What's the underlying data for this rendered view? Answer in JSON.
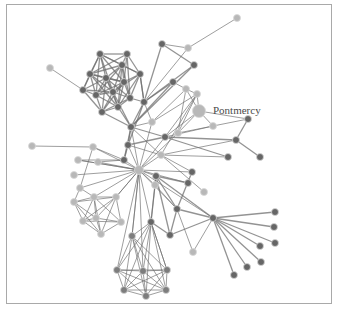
{
  "diagram": {
    "type": "force-directed-network",
    "label": {
      "text": "Pontmercy",
      "x": 213,
      "y": 114
    },
    "colors": {
      "dark": "#666666",
      "mid": "#7d7d7d",
      "light": "#b8b8b8",
      "edge": "#6f6f6f",
      "frame": "#a9a9a9"
    },
    "nodes": [
      {
        "id": 0,
        "x": 139,
        "y": 170,
        "r": 4.5,
        "c": "light"
      },
      {
        "id": 1,
        "x": 131,
        "y": 127,
        "r": 3.5,
        "c": "dark"
      },
      {
        "id": 2,
        "x": 144,
        "y": 102,
        "r": 3.5,
        "c": "dark"
      },
      {
        "id": 3,
        "x": 162,
        "y": 44,
        "r": 3.5,
        "c": "dark"
      },
      {
        "id": 4,
        "x": 188,
        "y": 48,
        "r": 3.5,
        "c": "light"
      },
      {
        "id": 5,
        "x": 237,
        "y": 18,
        "r": 3.5,
        "c": "light"
      },
      {
        "id": 6,
        "x": 194,
        "y": 65,
        "r": 3.5,
        "c": "dark"
      },
      {
        "id": 7,
        "x": 173,
        "y": 82,
        "r": 3.5,
        "c": "dark"
      },
      {
        "id": 8,
        "x": 186,
        "y": 89,
        "r": 3.5,
        "c": "light"
      },
      {
        "id": 9,
        "x": 199,
        "y": 111,
        "r": 6.5,
        "c": "light"
      },
      {
        "id": 10,
        "x": 197,
        "y": 94,
        "r": 3.5,
        "c": "light"
      },
      {
        "id": 11,
        "x": 213,
        "y": 126,
        "r": 3.5,
        "c": "light"
      },
      {
        "id": 12,
        "x": 248,
        "y": 119,
        "r": 3.5,
        "c": "dark"
      },
      {
        "id": 13,
        "x": 236,
        "y": 140,
        "r": 3.5,
        "c": "dark"
      },
      {
        "id": 14,
        "x": 260,
        "y": 157,
        "r": 3.5,
        "c": "dark"
      },
      {
        "id": 15,
        "x": 228,
        "y": 157,
        "r": 3.5,
        "c": "dark"
      },
      {
        "id": 16,
        "x": 192,
        "y": 172,
        "r": 3.5,
        "c": "dark"
      },
      {
        "id": 17,
        "x": 188,
        "y": 183,
        "r": 3.5,
        "c": "dark"
      },
      {
        "id": 18,
        "x": 204,
        "y": 192,
        "r": 3.5,
        "c": "light"
      },
      {
        "id": 19,
        "x": 213,
        "y": 218,
        "r": 3.5,
        "c": "dark"
      },
      {
        "id": 20,
        "x": 275,
        "y": 212,
        "r": 3.5,
        "c": "dark"
      },
      {
        "id": 21,
        "x": 274,
        "y": 227,
        "r": 3.5,
        "c": "dark"
      },
      {
        "id": 22,
        "x": 275,
        "y": 243,
        "r": 3.5,
        "c": "dark"
      },
      {
        "id": 23,
        "x": 260,
        "y": 246,
        "r": 3.5,
        "c": "dark"
      },
      {
        "id": 24,
        "x": 261,
        "y": 262,
        "r": 3.5,
        "c": "dark"
      },
      {
        "id": 25,
        "x": 247,
        "y": 267,
        "r": 3.5,
        "c": "dark"
      },
      {
        "id": 26,
        "x": 234,
        "y": 275,
        "r": 3.5,
        "c": "dark"
      },
      {
        "id": 27,
        "x": 193,
        "y": 252,
        "r": 3.5,
        "c": "light"
      },
      {
        "id": 28,
        "x": 177,
        "y": 209,
        "r": 3.5,
        "c": "dark"
      },
      {
        "id": 29,
        "x": 170,
        "y": 235,
        "r": 3.5,
        "c": "dark"
      },
      {
        "id": 30,
        "x": 156,
        "y": 176,
        "r": 3.5,
        "c": "dark"
      },
      {
        "id": 31,
        "x": 161,
        "y": 155,
        "r": 3.5,
        "c": "light"
      },
      {
        "id": 32,
        "x": 165,
        "y": 137,
        "r": 3.5,
        "c": "dark"
      },
      {
        "id": 33,
        "x": 178,
        "y": 133,
        "r": 3.5,
        "c": "light"
      },
      {
        "id": 34,
        "x": 152,
        "y": 122,
        "r": 3.5,
        "c": "light"
      },
      {
        "id": 35,
        "x": 128,
        "y": 145,
        "r": 3.5,
        "c": "dark"
      },
      {
        "id": 36,
        "x": 32,
        "y": 146,
        "r": 3.5,
        "c": "light"
      },
      {
        "id": 37,
        "x": 93,
        "y": 147,
        "r": 3.5,
        "c": "light"
      },
      {
        "id": 38,
        "x": 78,
        "y": 160,
        "r": 3.5,
        "c": "light"
      },
      {
        "id": 39,
        "x": 98,
        "y": 162,
        "r": 3.5,
        "c": "light"
      },
      {
        "id": 40,
        "x": 74,
        "y": 175,
        "r": 3.5,
        "c": "light"
      },
      {
        "id": 41,
        "x": 80,
        "y": 188,
        "r": 3.5,
        "c": "light"
      },
      {
        "id": 42,
        "x": 94,
        "y": 197,
        "r": 3.5,
        "c": "light"
      },
      {
        "id": 43,
        "x": 74,
        "y": 202,
        "r": 3.5,
        "c": "light"
      },
      {
        "id": 44,
        "x": 116,
        "y": 197,
        "r": 3.5,
        "c": "light"
      },
      {
        "id": 45,
        "x": 96,
        "y": 218,
        "r": 3.5,
        "c": "light"
      },
      {
        "id": 46,
        "x": 83,
        "y": 221,
        "r": 3.5,
        "c": "light"
      },
      {
        "id": 47,
        "x": 121,
        "y": 222,
        "r": 3.5,
        "c": "light"
      },
      {
        "id": 48,
        "x": 101,
        "y": 234,
        "r": 3.5,
        "c": "light"
      },
      {
        "id": 49,
        "x": 151,
        "y": 222,
        "r": 3.5,
        "c": "dark"
      },
      {
        "id": 50,
        "x": 132,
        "y": 236,
        "r": 3.5,
        "c": "mid"
      },
      {
        "id": 51,
        "x": 117,
        "y": 270,
        "r": 3.5,
        "c": "mid"
      },
      {
        "id": 52,
        "x": 143,
        "y": 271,
        "r": 3.5,
        "c": "mid"
      },
      {
        "id": 53,
        "x": 167,
        "y": 270,
        "r": 3.5,
        "c": "mid"
      },
      {
        "id": 54,
        "x": 124,
        "y": 290,
        "r": 3.5,
        "c": "mid"
      },
      {
        "id": 55,
        "x": 146,
        "y": 296,
        "r": 3.5,
        "c": "mid"
      },
      {
        "id": 56,
        "x": 166,
        "y": 290,
        "r": 3.5,
        "c": "mid"
      },
      {
        "id": 57,
        "x": 50,
        "y": 68,
        "r": 3.5,
        "c": "light"
      },
      {
        "id": 58,
        "x": 83,
        "y": 90,
        "r": 3.5,
        "c": "dark"
      },
      {
        "id": 59,
        "x": 90,
        "y": 74,
        "r": 3.5,
        "c": "dark"
      },
      {
        "id": 60,
        "x": 100,
        "y": 54,
        "r": 3.5,
        "c": "dark"
      },
      {
        "id": 61,
        "x": 127,
        "y": 54,
        "r": 3.5,
        "c": "dark"
      },
      {
        "id": 62,
        "x": 122,
        "y": 65,
        "r": 3.5,
        "c": "dark"
      },
      {
        "id": 63,
        "x": 106,
        "y": 78,
        "r": 3.5,
        "c": "dark"
      },
      {
        "id": 64,
        "x": 124,
        "y": 82,
        "r": 3.5,
        "c": "dark"
      },
      {
        "id": 65,
        "x": 140,
        "y": 74,
        "r": 3.5,
        "c": "dark"
      },
      {
        "id": 66,
        "x": 96,
        "y": 95,
        "r": 3.5,
        "c": "dark"
      },
      {
        "id": 67,
        "x": 118,
        "y": 107,
        "r": 3.5,
        "c": "dark"
      },
      {
        "id": 68,
        "x": 102,
        "y": 112,
        "r": 3.5,
        "c": "dark"
      },
      {
        "id": 69,
        "x": 130,
        "y": 98,
        "r": 3.5,
        "c": "dark"
      },
      {
        "id": 70,
        "x": 113,
        "y": 92,
        "r": 3.5,
        "c": "dark"
      },
      {
        "id": 71,
        "x": 155,
        "y": 185,
        "r": 3.5,
        "c": "light"
      },
      {
        "id": 72,
        "x": 124,
        "y": 160,
        "r": 3.5,
        "c": "dark"
      }
    ],
    "edges": [
      [
        57,
        58
      ],
      [
        58,
        59
      ],
      [
        58,
        60
      ],
      [
        58,
        63
      ],
      [
        58,
        66
      ],
      [
        58,
        68
      ],
      [
        58,
        70
      ],
      [
        59,
        60
      ],
      [
        59,
        61
      ],
      [
        59,
        62
      ],
      [
        59,
        63
      ],
      [
        59,
        64
      ],
      [
        59,
        66
      ],
      [
        59,
        67
      ],
      [
        59,
        70
      ],
      [
        60,
        61
      ],
      [
        60,
        62
      ],
      [
        60,
        63
      ],
      [
        60,
        64
      ],
      [
        60,
        65
      ],
      [
        60,
        66
      ],
      [
        60,
        70
      ],
      [
        61,
        62
      ],
      [
        61,
        64
      ],
      [
        61,
        65
      ],
      [
        61,
        69
      ],
      [
        62,
        63
      ],
      [
        62,
        64
      ],
      [
        62,
        65
      ],
      [
        62,
        66
      ],
      [
        62,
        67
      ],
      [
        62,
        69
      ],
      [
        62,
        70
      ],
      [
        63,
        64
      ],
      [
        63,
        66
      ],
      [
        63,
        67
      ],
      [
        63,
        68
      ],
      [
        63,
        69
      ],
      [
        63,
        70
      ],
      [
        64,
        65
      ],
      [
        64,
        66
      ],
      [
        64,
        67
      ],
      [
        64,
        68
      ],
      [
        64,
        69
      ],
      [
        64,
        70
      ],
      [
        65,
        67
      ],
      [
        65,
        69
      ],
      [
        65,
        70
      ],
      [
        66,
        67
      ],
      [
        66,
        68
      ],
      [
        66,
        70
      ],
      [
        67,
        68
      ],
      [
        67,
        69
      ],
      [
        67,
        70
      ],
      [
        68,
        69
      ],
      [
        68,
        70
      ],
      [
        69,
        70
      ],
      [
        69,
        2
      ],
      [
        67,
        1
      ],
      [
        65,
        2
      ],
      [
        68,
        1
      ],
      [
        70,
        1
      ],
      [
        1,
        2
      ],
      [
        1,
        34
      ],
      [
        1,
        35
      ],
      [
        1,
        0
      ],
      [
        1,
        72
      ],
      [
        1,
        31
      ],
      [
        1,
        32
      ],
      [
        2,
        34
      ],
      [
        2,
        3
      ],
      [
        2,
        7
      ],
      [
        2,
        65
      ],
      [
        2,
        6
      ],
      [
        3,
        4
      ],
      [
        3,
        6
      ],
      [
        4,
        5
      ],
      [
        4,
        2
      ],
      [
        6,
        1
      ],
      [
        7,
        8
      ],
      [
        7,
        1
      ],
      [
        8,
        9
      ],
      [
        8,
        10
      ],
      [
        8,
        33
      ],
      [
        8,
        34
      ],
      [
        9,
        10
      ],
      [
        9,
        11
      ],
      [
        9,
        12
      ],
      [
        9,
        32
      ],
      [
        9,
        33
      ],
      [
        10,
        33
      ],
      [
        10,
        32
      ],
      [
        10,
        31
      ],
      [
        10,
        34
      ],
      [
        11,
        32
      ],
      [
        11,
        33
      ],
      [
        11,
        12
      ],
      [
        12,
        13
      ],
      [
        13,
        14
      ],
      [
        13,
        32
      ],
      [
        13,
        31
      ],
      [
        15,
        31
      ],
      [
        15,
        32
      ],
      [
        16,
        31
      ],
      [
        16,
        0
      ],
      [
        17,
        30
      ],
      [
        17,
        0
      ],
      [
        18,
        31
      ],
      [
        0,
        30
      ],
      [
        0,
        31
      ],
      [
        0,
        32
      ],
      [
        0,
        33
      ],
      [
        0,
        34
      ],
      [
        0,
        35
      ],
      [
        0,
        72
      ],
      [
        0,
        37
      ],
      [
        0,
        38
      ],
      [
        0,
        39
      ],
      [
        0,
        40
      ],
      [
        0,
        41
      ],
      [
        0,
        42
      ],
      [
        0,
        44
      ],
      [
        0,
        71
      ],
      [
        0,
        19
      ],
      [
        0,
        49
      ],
      [
        0,
        50
      ],
      [
        0,
        28
      ],
      [
        35,
        72
      ],
      [
        35,
        31
      ],
      [
        35,
        32
      ],
      [
        35,
        2
      ],
      [
        72,
        37
      ],
      [
        72,
        39
      ],
      [
        72,
        38
      ],
      [
        36,
        37
      ],
      [
        37,
        41
      ],
      [
        38,
        0
      ],
      [
        42,
        43
      ],
      [
        42,
        44
      ],
      [
        42,
        45
      ],
      [
        42,
        46
      ],
      [
        42,
        47
      ],
      [
        42,
        48
      ],
      [
        43,
        44
      ],
      [
        43,
        45
      ],
      [
        43,
        46
      ],
      [
        43,
        48
      ],
      [
        44,
        45
      ],
      [
        44,
        46
      ],
      [
        44,
        47
      ],
      [
        44,
        48
      ],
      [
        45,
        46
      ],
      [
        45,
        47
      ],
      [
        45,
        48
      ],
      [
        46,
        47
      ],
      [
        46,
        48
      ],
      [
        47,
        48
      ],
      [
        41,
        42
      ],
      [
        41,
        43
      ],
      [
        44,
        0
      ],
      [
        19,
        20
      ],
      [
        19,
        21
      ],
      [
        19,
        22
      ],
      [
        19,
        23
      ],
      [
        19,
        24
      ],
      [
        19,
        25
      ],
      [
        19,
        26
      ],
      [
        19,
        27
      ],
      [
        19,
        28
      ],
      [
        19,
        29
      ],
      [
        19,
        30
      ],
      [
        28,
        29
      ],
      [
        28,
        30
      ],
      [
        28,
        16
      ],
      [
        28,
        27
      ],
      [
        29,
        30
      ],
      [
        29,
        49
      ],
      [
        30,
        71
      ],
      [
        30,
        49
      ],
      [
        71,
        49
      ],
      [
        71,
        28
      ],
      [
        49,
        50
      ],
      [
        49,
        51
      ],
      [
        49,
        52
      ],
      [
        49,
        53
      ],
      [
        49,
        54
      ],
      [
        49,
        55
      ],
      [
        49,
        56
      ],
      [
        50,
        51
      ],
      [
        50,
        52
      ],
      [
        50,
        53
      ],
      [
        50,
        54
      ],
      [
        50,
        55
      ],
      [
        50,
        56
      ],
      [
        51,
        52
      ],
      [
        51,
        53
      ],
      [
        51,
        54
      ],
      [
        51,
        55
      ],
      [
        51,
        56
      ],
      [
        52,
        53
      ],
      [
        52,
        54
      ],
      [
        52,
        55
      ],
      [
        52,
        56
      ],
      [
        53,
        54
      ],
      [
        53,
        55
      ],
      [
        53,
        56
      ],
      [
        54,
        55
      ],
      [
        54,
        56
      ],
      [
        55,
        56
      ],
      [
        50,
        0
      ],
      [
        51,
        0
      ],
      [
        52,
        0
      ],
      [
        53,
        49
      ]
    ]
  }
}
